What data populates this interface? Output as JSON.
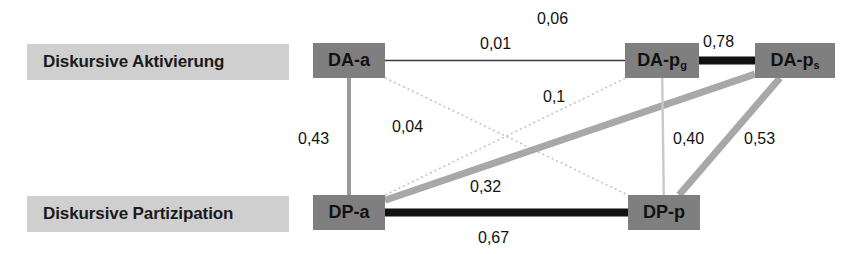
{
  "diagram": {
    "type": "network-path-diagram",
    "row_labels": [
      {
        "id": "activation",
        "text": "Diskursive Aktivierung"
      },
      {
        "id": "participation",
        "text": "Diskursive Partizipation"
      }
    ],
    "nodes": [
      {
        "id": "da-a",
        "label": "DA-a",
        "sub": "",
        "row": "activation",
        "x": 313,
        "y": 43,
        "w": 72,
        "h": 35
      },
      {
        "id": "da-pg",
        "label": "DA-p",
        "sub": "g",
        "row": "activation",
        "x": 625,
        "y": 43,
        "w": 74,
        "h": 35
      },
      {
        "id": "da-ps",
        "label": "DA-p",
        "sub": "s",
        "row": "activation",
        "x": 755,
        "y": 43,
        "w": 80,
        "h": 35
      },
      {
        "id": "dp-a",
        "label": "DP-a",
        "sub": "",
        "row": "participation",
        "x": 313,
        "y": 195,
        "w": 72,
        "h": 35
      },
      {
        "id": "dp-p",
        "label": "DP-p",
        "sub": "",
        "row": "participation",
        "x": 628,
        "y": 195,
        "w": 72,
        "h": 35
      }
    ],
    "edges": [
      {
        "id": "e-daa-dapg",
        "from": "da-a",
        "to": "da-pg",
        "value": "0,01",
        "style": "solid",
        "weight": 1.4,
        "color": "#3a3a3a",
        "label_x": 480,
        "label_y": 35
      },
      {
        "id": "e-daa-daps",
        "from": "da-a",
        "to": "da-ps",
        "value": "0,06",
        "style": "none",
        "weight": 0,
        "color": "#ffffff",
        "label_x": 537,
        "label_y": 10
      },
      {
        "id": "e-dapg-daps",
        "from": "da-pg",
        "to": "da-ps",
        "value": "0,78",
        "style": "solid",
        "weight": 8,
        "color": "#111111",
        "label_x": 703,
        "label_y": 33
      },
      {
        "id": "e-daa-dpa",
        "from": "da-a",
        "to": "dp-a",
        "value": "0,43",
        "style": "solid",
        "weight": 4,
        "color": "#9a9a9a",
        "label_x": 298,
        "label_y": 130
      },
      {
        "id": "e-daa-dpp",
        "from": "da-a",
        "to": "dp-p",
        "value": "0,04",
        "style": "dotted",
        "weight": 1.6,
        "color": "#c3c3c3",
        "label_x": 392,
        "label_y": 118
      },
      {
        "id": "e-dpa-dapg",
        "from": "dp-a",
        "to": "da-pg",
        "value": "0,1",
        "style": "dotted",
        "weight": 1.6,
        "color": "#c3c3c3",
        "label_x": 543,
        "label_y": 88
      },
      {
        "id": "e-dpa-daps",
        "from": "dp-a",
        "to": "da-ps",
        "value": "0,32",
        "style": "solid",
        "weight": 7,
        "color": "#a8a8a8",
        "label_x": 470,
        "label_y": 178
      },
      {
        "id": "e-dapg-dpp",
        "from": "da-pg",
        "to": "dp-p",
        "value": "0,40",
        "style": "solid",
        "weight": 2.4,
        "color": "#c9c9c9",
        "label_x": 673,
        "label_y": 130
      },
      {
        "id": "e-daps-dpp",
        "from": "da-ps",
        "to": "dp-p",
        "value": "0,53",
        "style": "solid",
        "weight": 7,
        "color": "#a8a8a8",
        "label_x": 744,
        "label_y": 130
      },
      {
        "id": "e-dpa-dpp",
        "from": "dp-a",
        "to": "dp-p",
        "value": "0,67",
        "style": "solid",
        "weight": 8,
        "color": "#111111",
        "label_x": 478,
        "label_y": 229
      }
    ],
    "colors": {
      "node_fill": "#7f7f7f",
      "row_label_fill": "#cfcfcf",
      "text": "#111111",
      "background": "#ffffff",
      "strong_edge": "#111111",
      "medium_edge": "#a8a8a8",
      "weak_edge": "#c3c3c3"
    }
  }
}
